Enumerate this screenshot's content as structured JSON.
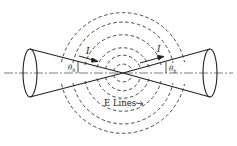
{
  "diagram": {
    "labels": {
      "current_left": "I",
      "current_right": "I",
      "angle_left": "θh",
      "angle_left_main": "θ",
      "angle_left_sub": "h",
      "angle_right_main": "θ",
      "angle_right_sub": "h",
      "e_lines": "E Lines"
    },
    "colors": {
      "stroke": "#222222",
      "dashed": "#333333",
      "background": "#ffffff"
    }
  }
}
